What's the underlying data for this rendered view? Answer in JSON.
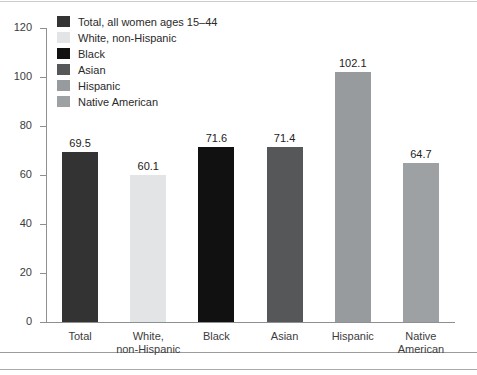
{
  "chart_data": {
    "type": "bar",
    "title": "",
    "subtitle": "",
    "xlabel": "",
    "ylabel": "",
    "ylim": [
      0,
      120
    ],
    "ytick_step": 20,
    "yticks": [
      "0",
      "20",
      "40",
      "60",
      "80",
      "100",
      "120"
    ],
    "grid": false,
    "legend_position": "top-left-inside",
    "categories": [
      "Total",
      "White,\nnon-Hispanic",
      "Black",
      "Asian",
      "Hispanic",
      "Native\nAmerican"
    ],
    "category_lines": [
      [
        "Total"
      ],
      [
        "White,",
        "non-Hispanic"
      ],
      [
        "Black"
      ],
      [
        "Asian"
      ],
      [
        "Hispanic"
      ],
      [
        "Native",
        "American"
      ]
    ],
    "values": [
      69.5,
      60.1,
      71.6,
      71.4,
      102.1,
      64.7
    ],
    "value_labels": [
      "69.5",
      "60.1",
      "71.6",
      "71.4",
      "102.1",
      "64.7"
    ],
    "bar_colors": [
      "#333333",
      "#e2e4e5",
      "#111111",
      "#555758",
      "#989b9d",
      "#9ea1a3"
    ],
    "legend": [
      {
        "label": "Total, all women ages 15–44",
        "color": "#333333"
      },
      {
        "label": "White, non-Hispanic",
        "color": "#e2e4e5"
      },
      {
        "label": "Black",
        "color": "#111111"
      },
      {
        "label": "Asian",
        "color": "#555758"
      },
      {
        "label": "Hispanic",
        "color": "#989b9d"
      },
      {
        "label": "Native American",
        "color": "#9ea1a3"
      }
    ]
  },
  "colors": {
    "axis": "#8d9092",
    "rule": "#a8abad",
    "text": "#3c3c3c",
    "background": "#ffffff"
  }
}
